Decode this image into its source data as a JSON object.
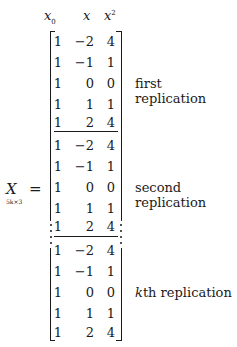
{
  "headers": [
    {
      "base": "x",
      "sub": "0",
      "sup": ""
    },
    {
      "base": "x",
      "sub": "",
      "sup": ""
    },
    {
      "base": "x",
      "sub": "",
      "sup": "2"
    }
  ],
  "lhs": {
    "symbol": "X",
    "subscript": "5k×3",
    "equals": "="
  },
  "blocks": [
    {
      "label": "first replication",
      "rows": [
        [
          "1",
          "−2",
          "4"
        ],
        [
          "1",
          "−1",
          "1"
        ],
        [
          "1",
          "0",
          "0"
        ],
        [
          "1",
          "1",
          "1"
        ],
        [
          "1",
          "2",
          "4"
        ]
      ]
    },
    {
      "label": "second replication",
      "rows": [
        [
          "1",
          "−2",
          "4"
        ],
        [
          "1",
          "−1",
          "1"
        ],
        [
          "1",
          "0",
          "0"
        ],
        [
          "1",
          "1",
          "1"
        ],
        [
          "1",
          "2",
          "4"
        ]
      ]
    },
    {
      "label_k": "k",
      "label": "th replication",
      "rows": [
        [
          "1",
          "−2",
          "4"
        ],
        [
          "1",
          "−1",
          "1"
        ],
        [
          "1",
          "0",
          "0"
        ],
        [
          "1",
          "1",
          "1"
        ],
        [
          "1",
          "2",
          "4"
        ]
      ]
    }
  ]
}
